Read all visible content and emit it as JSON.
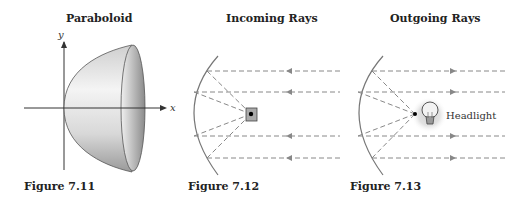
{
  "figures": [
    {
      "title": "Paraboloid",
      "caption": "Figure 7.11",
      "axes": {
        "x_label": "x",
        "y_label": "y"
      }
    },
    {
      "title": "Incoming Rays",
      "caption": "Figure 7.12",
      "ray_direction": "left"
    },
    {
      "title": "Outgoing Rays",
      "caption": "Figure 7.13",
      "ray_direction": "right",
      "label": "Headlight"
    }
  ],
  "colors": {
    "text": "#222222",
    "ray": "#888888",
    "mirror": "#777777",
    "axis": "#333333"
  }
}
